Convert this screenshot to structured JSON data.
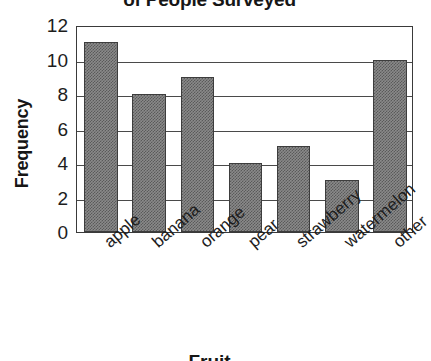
{
  "chart_data": {
    "type": "bar",
    "title": "of People Surveyed",
    "xlabel": "Fruit",
    "ylabel": "Frequency",
    "categories": [
      "apple",
      "banana",
      "orange",
      "pear",
      "strawberry",
      "watermelon",
      "other"
    ],
    "values": [
      11,
      8,
      9,
      4,
      5,
      3,
      10
    ],
    "yticks": [
      12,
      10,
      8,
      6,
      4,
      2,
      0
    ],
    "ylim": [
      0,
      12
    ],
    "grid": true,
    "legend": "none",
    "series_name": "Frequency",
    "bar_color": "#8a8a8a",
    "bar_edge_color": "#3d3d3d",
    "axis_color": "#3a3a3a",
    "background_color": "#ffffff"
  }
}
